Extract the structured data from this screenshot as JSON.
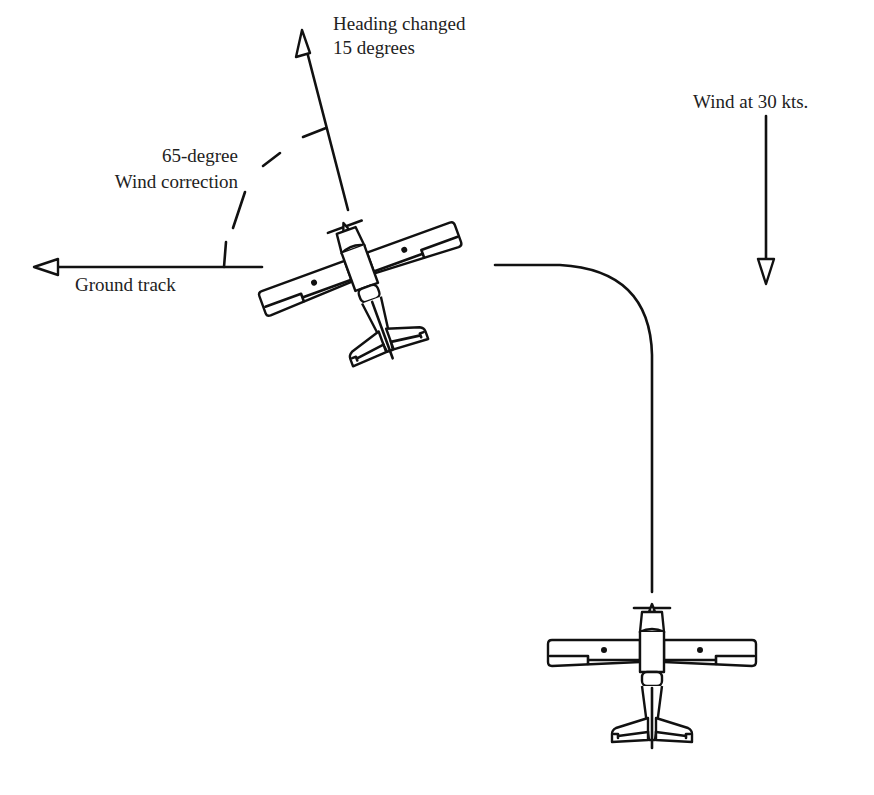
{
  "diagram": {
    "labels": {
      "heading_line1": "Heading changed",
      "heading_line2": "15 degrees",
      "correction_line1": "65-degree",
      "correction_line2": "Wind correction",
      "ground_track": "Ground track",
      "wind": "Wind at 30 kts."
    },
    "elements": [
      {
        "name": "heading-arrow",
        "direction": "up, tilted ~15deg left"
      },
      {
        "name": "ground-track-arrow",
        "direction": "left"
      },
      {
        "name": "wind-arrow",
        "direction": "down"
      },
      {
        "name": "wind-correction-arc",
        "style": "dashed",
        "angle_degrees": 65
      },
      {
        "name": "turn-path",
        "description": "horizontal line curving down into vertical"
      },
      {
        "name": "airplane-corrected",
        "rotation_degrees": -20
      },
      {
        "name": "airplane-initial",
        "rotation_degrees": 0
      }
    ],
    "colors": {
      "stroke": "#111111",
      "background": "#ffffff",
      "text": "#222222"
    }
  }
}
